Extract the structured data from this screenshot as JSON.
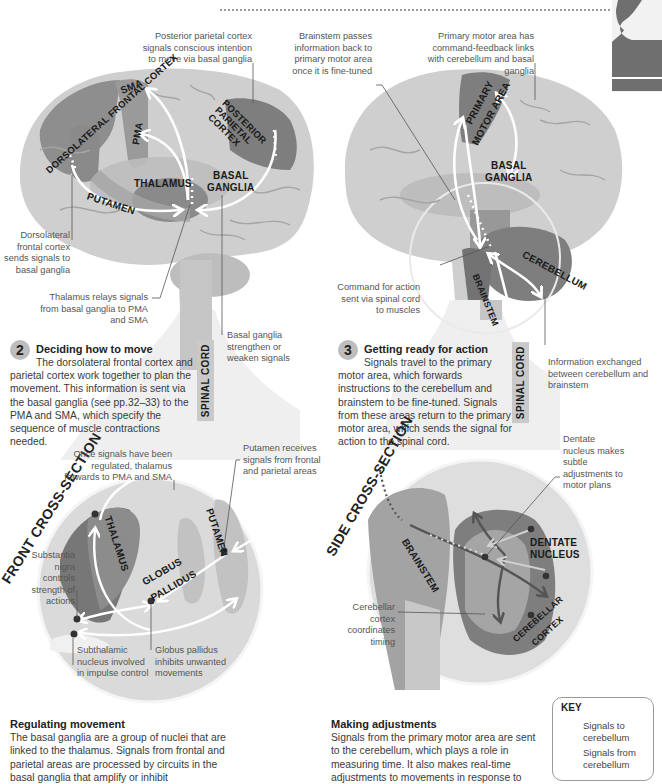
{
  "header": {
    "thumbnail_icon": "person-silhouette-thumbnail"
  },
  "panel_left": {
    "annotations": {
      "posterior_parietal": "Posterior parietal cortex signals conscious intention to move via basal ganglia",
      "dorsolateral_sends": "Dorsolateral frontal cortex sends signals to basal ganglia",
      "thalamus_relays": "Thalamus relays signals from basal ganglia to PMA and SMA",
      "basal_strengthen": "Basal ganglia strengthen or weaken signals"
    },
    "labels": {
      "dorsolateral": "DORSOLATERAL FRONTAL CORTEX",
      "sma": "SMA",
      "pma": "PMA",
      "posterior_parietal": "POSTERIOR PARIETAL CORTEX",
      "thalamus": "THALAMUS",
      "basal_ganglia_1": "BASAL",
      "basal_ganglia_2": "GANGLIA",
      "putamen": "PUTAMEN",
      "spinal_cord": "SPINAL CORD"
    },
    "step": {
      "number": "2",
      "title": "Deciding how to move",
      "body": "The dorsolateral frontal cortex and parietal cortex work together to plan the movement. This information is sent via the basal ganglia (see pp.32–33) to the PMA and SMA, which specify the sequence of muscle contractions needed."
    }
  },
  "panel_right": {
    "annotations": {
      "brainstem_passes": "Brainstem passes information back to primary motor area once it is fine-tuned",
      "primary_motor_links": "Primary motor area has command-feedback links with cerebellum and basal ganglia",
      "command_for_action": "Command for action sent via spinal cord to muscles",
      "info_exchanged": "Information exchanged between cerebellum and brainstem"
    },
    "labels": {
      "primary_motor_1": "PRIMARY",
      "primary_motor_2": "MOTOR AREA",
      "basal_ganglia_1": "BASAL",
      "basal_ganglia_2": "GANGLIA",
      "cerebellum": "CEREBELLUM",
      "brainstem": "BRAINSTEM",
      "spinal_cord": "SPINAL CORD"
    },
    "step": {
      "number": "3",
      "title": "Getting ready for action",
      "body": "Signals travel to the primary motor area, which forwards instructions to the cerebellum and brainstem to be fine-tuned. Signals from these areas return to the primary motor area, which sends the signal for action to the spinal cord."
    }
  },
  "front_section": {
    "title": "FRONT CROSS-SECTION",
    "labels": {
      "thalamus": "THALAMUS",
      "putamen": "PUTAMEN",
      "globus_1": "GLOBUS",
      "globus_2": "PALLIDUS"
    },
    "annotations": {
      "once_signals": "Once signals have been regulated, thalamus forwards to PMA and SMA",
      "putamen_receives": "Putamen receives signals from frontal and parietal areas",
      "substantia": "Substantia nigra controls strength of actions",
      "subthalamic": "Subthalamic nucleus involved in impulse control",
      "globus_inhibits": "Globus pallidus inhibits unwanted movements"
    },
    "caption": {
      "title": "Regulating movement",
      "body": "The basal ganglia are a group of nuclei that are linked to the thalamus. Signals from frontal and parietal areas are processed by circuits in the basal ganglia that amplify or inhibit"
    }
  },
  "side_section": {
    "title": "SIDE CROSS-SECTION",
    "labels": {
      "brainstem": "BRAINSTEM",
      "dentate_1": "DENTATE",
      "dentate_2": "NUCLEUS",
      "cerebellar_cortex_1": "CEREBELLAR",
      "cerebellar_cortex_2": "CORTEX"
    },
    "annotations": {
      "dentate": "Dentate nucleus makes subtle adjustments to motor plans",
      "cerebellar_cortex": "Cerebellar cortex coordinates timing"
    },
    "caption": {
      "title": "Making adjustments",
      "body": "Signals from the primary motor area are sent to the cerebellum, which plays a role in measuring time. It also makes real-time adjustments to movements in response to"
    }
  },
  "key": {
    "title": "KEY",
    "items": [
      {
        "label": "Signals to cerebellum",
        "color": "#4a4a4a"
      },
      {
        "label": "Signals from cerebellum",
        "color": "#c8c8c8"
      }
    ]
  },
  "colors": {
    "brain_light": "#c9c9c9",
    "brain_mid": "#a8a8a8",
    "region_dark": "#7c7c7c",
    "region_darker": "#666666",
    "circle_bg": "#dcdcdc",
    "arrow": "#ffffff",
    "text": "#3a3a3a"
  }
}
